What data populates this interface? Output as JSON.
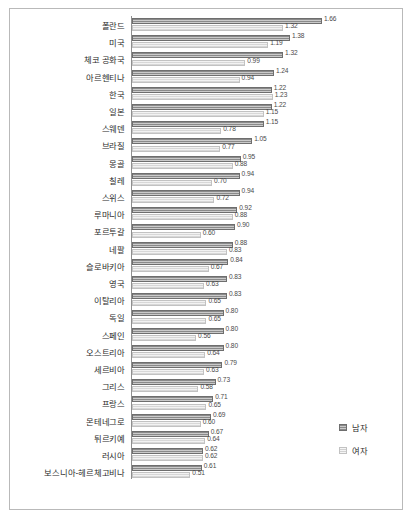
{
  "chart_data": {
    "type": "bar",
    "orientation": "horizontal",
    "title": "",
    "xlabel": "",
    "ylabel": "",
    "xlim": [
      0,
      1.66
    ],
    "grid": false,
    "legend_position": "bottom-right",
    "categories": [
      "폴란드",
      "미국",
      "체코 공화국",
      "아르헨티나",
      "한국",
      "일본",
      "스웨덴",
      "브라질",
      "몽골",
      "칠레",
      "스위스",
      "루마니아",
      "포르투갈",
      "네팔",
      "슬로바키아",
      "영국",
      "이탈리아",
      "독일",
      "스페인",
      "오스트리아",
      "세르비아",
      "그리스",
      "프랑스",
      "몬테네그로",
      "튀르키예",
      "러시아",
      "보스니아-헤르체고비나"
    ],
    "series": [
      {
        "name": "남자",
        "color": "#8a8a8a",
        "values": [
          1.66,
          1.38,
          1.32,
          1.24,
          1.22,
          1.22,
          1.15,
          1.05,
          0.95,
          0.94,
          0.94,
          0.92,
          0.9,
          0.88,
          0.84,
          0.83,
          0.83,
          0.8,
          0.8,
          0.8,
          0.79,
          0.73,
          0.71,
          0.69,
          0.67,
          0.62,
          0.61
        ],
        "labels": [
          "1.66",
          "1.38",
          "1.32",
          "1.24",
          "1.22",
          "1.22",
          "1.15",
          "1.05",
          "0.95",
          "0.94",
          "0.94",
          "0.92",
          "0.90",
          "0.88",
          "0.84",
          "0.83",
          "0.83",
          "0.80",
          "0.80",
          "0.80",
          "0.79",
          "0.73",
          "0.71",
          "0.69",
          "0.67",
          "0.62",
          "0.61"
        ]
      },
      {
        "name": "여자",
        "color": "#f2f2f2",
        "values": [
          1.32,
          1.19,
          0.99,
          0.94,
          1.23,
          1.15,
          0.78,
          0.77,
          0.88,
          0.7,
          0.72,
          0.88,
          0.6,
          0.83,
          0.67,
          0.63,
          0.65,
          0.65,
          0.56,
          0.64,
          0.63,
          0.58,
          0.65,
          0.6,
          0.64,
          0.62,
          0.51
        ],
        "labels": [
          "1.32",
          "1.19",
          "0.99",
          "0.94",
          "1.23",
          "1.15",
          "0.78",
          "0.77",
          "0.88",
          "0.70",
          "0.72",
          "0.88",
          "0.60",
          "0.83",
          "0.67",
          "0.63",
          "0.65",
          "0.65",
          "0.56",
          "0.64",
          "0.63",
          "0.58",
          "0.65",
          "0.60",
          "0.64",
          "0.62",
          "0.51"
        ]
      }
    ],
    "legend": [
      {
        "label": "남자",
        "key": "male"
      },
      {
        "label": "여자",
        "key": "female"
      }
    ]
  }
}
